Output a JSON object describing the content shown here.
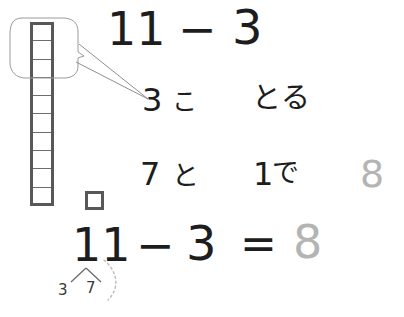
{
  "worksheet": {
    "title": "11 - 3 subtraction with regrouping (Japanese math worksheet)",
    "language": "ja"
  },
  "blocks": {
    "rod_label": "ten-rod",
    "rod_cell_count": 10,
    "unit_label": "one-unit-cube",
    "unit_count": 1,
    "total": 11
  },
  "callout": {
    "label": "highlight-balloon",
    "covers_cells": 3
  },
  "equation_top": {
    "minuend": "11",
    "operator": "−",
    "subtrahend": "3"
  },
  "step_take": {
    "count": "3",
    "counter": "こ",
    "verb": "とる"
  },
  "step_combine": {
    "left": "7",
    "conj": "と",
    "right": "1",
    "particle": "で",
    "result": "8"
  },
  "equation_bottom": {
    "minuend": "11",
    "operator": "−",
    "subtrahend": "3",
    "equals": "=",
    "result": "8"
  },
  "decomposition": {
    "left": "3",
    "right": "7"
  },
  "colors": {
    "ink": "#1d1d1d",
    "faded_answer": "#b4b4b4",
    "block_outline": "#58585a",
    "callout_outline": "#9a9a9a"
  }
}
